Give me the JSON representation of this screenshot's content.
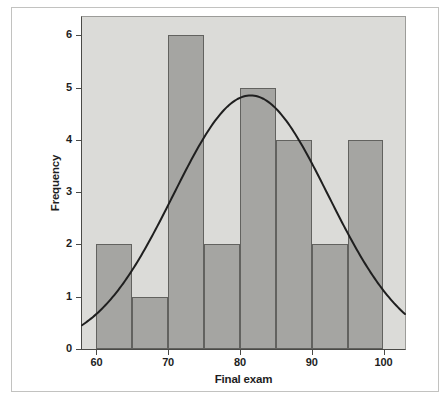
{
  "chart_data": {
    "type": "bar",
    "subtype": "histogram-with-normal-curve",
    "title": "",
    "xlabel": "Final exam",
    "ylabel": "Frequency",
    "bin_width": 5,
    "bin_edges": [
      60,
      65,
      70,
      75,
      80,
      85,
      90,
      95,
      100
    ],
    "frequencies": [
      2,
      1,
      6,
      2,
      5,
      4,
      2,
      4
    ],
    "n_total": 26,
    "x_ticks": [
      60,
      70,
      80,
      90,
      100
    ],
    "x_tick_labels": [
      "60",
      "70",
      "80",
      "90",
      "100"
    ],
    "y_ticks": [
      0,
      1,
      2,
      3,
      4,
      5,
      6
    ],
    "y_tick_labels": [
      "0",
      "1",
      "2",
      "3",
      "4",
      "5",
      "6"
    ],
    "xlim": [
      58,
      103
    ],
    "ylim": [
      0,
      6.35
    ],
    "grid": false,
    "legend": "none",
    "normal_curve": {
      "mean": 81.5,
      "sd": 10.8,
      "peak": 4.85
    },
    "colors": {
      "plot_background": "#dbdbd8",
      "bar_fill": "#a5a5a2",
      "bar_border": "#62625f",
      "curve": "#1f1f1f",
      "axis_line": "#4a4a47",
      "frame_border": "#c2c2c0",
      "text": "#1e1e1e"
    }
  }
}
